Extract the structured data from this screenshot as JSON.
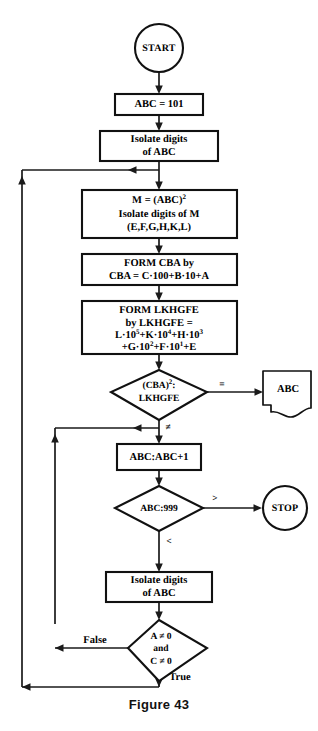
{
  "figure": {
    "caption": "Figure 43",
    "background_color": "#ffffff",
    "line_color": "#1a1a1a",
    "text_color": "#000000"
  },
  "nodes": {
    "start": {
      "shape": "circle",
      "label": "START"
    },
    "init": {
      "shape": "process",
      "label": "ABC = 101"
    },
    "isolate_abc_1": {
      "shape": "process",
      "line1": "Isolate digits",
      "line2": "of ABC"
    },
    "square_m": {
      "shape": "process",
      "line1_pre": "M = (ABC)",
      "line1_sup": "2",
      "line2": "Isolate digits of M",
      "line3": "(E,F,G,H,K,L)"
    },
    "form_cba": {
      "shape": "process",
      "line1": "FORM  CBA  by",
      "line2": "CBA = C·100+B·10+A"
    },
    "form_lkhgfe": {
      "shape": "process",
      "line1": "FORM  LKHGFE",
      "line2": "by  LKHGFE =",
      "line3_parts": [
        {
          "base": "L·10",
          "sup": "5"
        },
        {
          "base": "+K·10",
          "sup": "4"
        },
        {
          "base": "+H·10",
          "sup": "3"
        }
      ],
      "line4_parts": [
        {
          "base": "+G·10",
          "sup": "2"
        },
        {
          "base": "+F·10",
          "sup": "1"
        },
        {
          "base": "+E",
          "sup": ""
        }
      ]
    },
    "compare_squares": {
      "shape": "decision",
      "line1_pre": "(CBA)",
      "line1_sup": "2",
      "line1_post": ":",
      "line2": "LKHGFE"
    },
    "output_abc": {
      "shape": "document",
      "label": "ABC"
    },
    "increment": {
      "shape": "process",
      "label": "ABC:ABC+1"
    },
    "compare_999": {
      "shape": "decision",
      "label": "ABC:999"
    },
    "stop": {
      "shape": "circle",
      "label": "STOP"
    },
    "isolate_abc_2": {
      "shape": "process",
      "line1": "Isolate digits",
      "line2": "of ABC"
    },
    "check_nonzero": {
      "shape": "decision",
      "line1": "A ≠ 0",
      "line2": "and",
      "line3": "C ≠ 0"
    }
  },
  "branch_labels": {
    "equal": "=",
    "not_equal": "≠",
    "greater": ">",
    "less": "<",
    "false": "False",
    "true": "True"
  }
}
